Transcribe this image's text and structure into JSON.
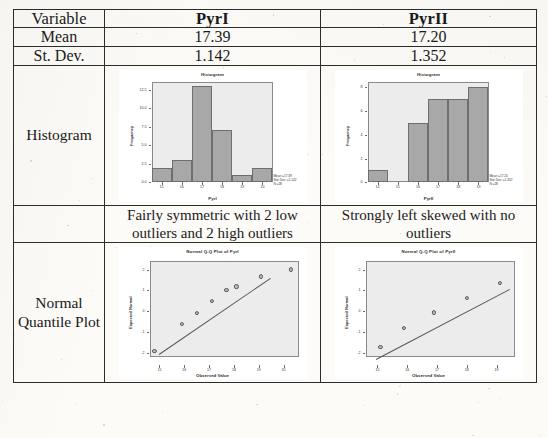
{
  "table": {
    "header": {
      "variable_label": "Variable",
      "col_a": "PyrI",
      "col_b": "PyrII"
    },
    "rows": {
      "mean": {
        "label": "Mean",
        "a": "17.39",
        "b": "17.20"
      },
      "st_dev": {
        "label": "St. Dev.",
        "a": "1.142",
        "b": "1.352"
      },
      "histogram": {
        "label": "Histogram"
      },
      "description": {
        "a": "Fairly symmetric with 2 low outliers and 2 high outliers",
        "b": "Strongly left skewed with no outliers"
      },
      "normal_quantile": {
        "label": "Normal Quantile Plot"
      }
    }
  },
  "chart_data": [
    {
      "type": "bar",
      "name": "histogram-pyr1",
      "title": "Histogram",
      "xlabel": "PyrI",
      "ylabel": "Frequency",
      "categories": [
        "15",
        "16",
        "17",
        "18",
        "19",
        "20"
      ],
      "values": [
        2,
        3,
        13,
        7,
        1,
        2
      ],
      "ylim": [
        0,
        13.5
      ],
      "yticks": [
        "0.0",
        "2.5",
        "5.0",
        "7.5",
        "10.0",
        "12.5"
      ],
      "ytickvals": [
        0,
        2.5,
        5,
        7.5,
        10,
        12.5
      ],
      "xticks": [
        "15",
        "16",
        "17",
        "18",
        "19",
        "20"
      ],
      "annotation": {
        "mean": "Mean =17.39",
        "std_dev": "Std. Dev. =1.142",
        "n": "N =28"
      },
      "grid": false,
      "legend": "none"
    },
    {
      "type": "bar",
      "name": "histogram-pyr2",
      "title": "Histogram",
      "xlabel": "PyrII",
      "ylabel": "Frequency",
      "categories": [
        "14",
        "15",
        "16",
        "17",
        "18",
        "19"
      ],
      "values": [
        1,
        0,
        5,
        7,
        7,
        8
      ],
      "ylim": [
        0,
        8.4
      ],
      "yticks": [
        "0",
        "2",
        "4",
        "6",
        "8"
      ],
      "ytickvals": [
        0,
        2,
        4,
        6,
        8
      ],
      "xticks": [
        "14",
        "15",
        "16",
        "17",
        "18",
        "19"
      ],
      "annotation": {
        "mean": "Mean =17.20",
        "std_dev": "Std. Dev. =1.352",
        "n": "N =28"
      },
      "grid": false,
      "legend": "none"
    },
    {
      "type": "scatter",
      "name": "qqplot-pyr1",
      "title": "Normal Q-Q Plot of PyrI",
      "xlabel": "Observed Value",
      "ylabel": "Expected Normal",
      "xticks": [
        "15",
        "16",
        "17",
        "18",
        "19",
        "20"
      ],
      "yticks": [
        "-2",
        "-1",
        "0",
        "1",
        "2"
      ],
      "xlim": [
        14.6,
        20.6
      ],
      "ylim": [
        -2.6,
        2.4
      ],
      "points": [
        {
          "x": 14.8,
          "y": -2.3
        },
        {
          "x": 15.9,
          "y": -1.02
        },
        {
          "x": 16.5,
          "y": -0.48
        },
        {
          "x": 17.1,
          "y": 0.12
        },
        {
          "x": 17.7,
          "y": 0.62
        },
        {
          "x": 18.1,
          "y": 0.8
        },
        {
          "x": 19.1,
          "y": 1.28
        },
        {
          "x": 20.3,
          "y": 1.62
        }
      ],
      "reference_line": {
        "x1": 15.0,
        "y1": -2.05,
        "x2": 19.5,
        "y2": 1.62
      },
      "grid": false,
      "legend": "none"
    },
    {
      "type": "scatter",
      "name": "qqplot-pyr2",
      "title": "Normal Q-Q Plot of PyrII",
      "xlabel": "Observed Value",
      "ylabel": "Expected Normal",
      "xticks": [
        "15",
        "16",
        "17",
        "18",
        "19"
      ],
      "yticks": [
        "-2",
        "-1",
        "0",
        "1",
        "2"
      ],
      "xlim": [
        14.6,
        19.6
      ],
      "ylim": [
        -2.6,
        2.4
      ],
      "points": [
        {
          "x": 15.1,
          "y": -2.1
        },
        {
          "x": 15.9,
          "y": -1.2
        },
        {
          "x": 16.9,
          "y": -0.45
        },
        {
          "x": 18.0,
          "y": 0.25
        },
        {
          "x": 19.1,
          "y": 0.95
        }
      ],
      "reference_line": {
        "x1": 14.95,
        "y1": -2.28,
        "x2": 19.45,
        "y2": 1.1
      },
      "grid": false,
      "legend": "none"
    }
  ]
}
